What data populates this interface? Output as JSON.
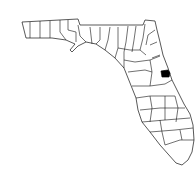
{
  "map": {
    "region": "Florida",
    "subdivision": "counties",
    "highlighted_county": "Seminole",
    "highlight_color": "#000000",
    "outline_color": "#111111",
    "background": "#ffffff"
  }
}
